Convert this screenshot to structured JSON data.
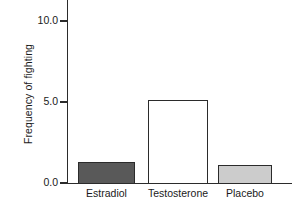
{
  "chart_data": {
    "type": "bar",
    "title": "",
    "xlabel": "",
    "ylabel": "Frequency of fighting",
    "categories": [
      "Estradiol",
      "Testosterone",
      "Placebo"
    ],
    "values": [
      1.35,
      5.2,
      1.2
    ],
    "bar_colors": [
      "#595959",
      "#ffffff",
      "#cccccc"
    ],
    "bar_edge_color": "#2b2b2b",
    "ylim": [
      0.0,
      11.3
    ],
    "yticks": [
      0.0,
      5.0,
      10.0
    ],
    "ytick_labels": [
      "0.0",
      "5.0",
      "10.0"
    ],
    "grid": false,
    "legend": "none"
  },
  "axis": {
    "y_title": "Frequency of fighting"
  }
}
